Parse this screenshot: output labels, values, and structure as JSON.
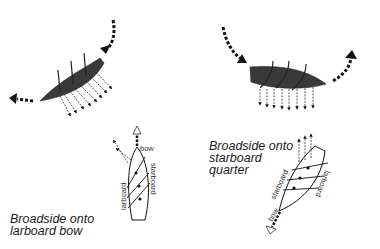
{
  "diagram": {
    "colors": {
      "hull_fill": "#3a3a3a",
      "ink": "#111111",
      "paper": "#ffffff"
    },
    "panels": [
      {
        "id": "top-left",
        "description": "Dark hull ship angled up-right, broadside fire arrows downward-right, curved dashed movement arrows"
      },
      {
        "id": "top-right",
        "description": "Dark hull ship horizontal, broadside fire arrows straight down, curved dashed movement arrows"
      },
      {
        "id": "bottom-left",
        "caption": "Broadside onto\nlarboard bow",
        "labels": {
          "bow": "bow",
          "starboard": "starboard",
          "larboard": "larboard"
        }
      },
      {
        "id": "bottom-right",
        "caption": "Broadside onto\nstarboard\nquarter",
        "labels": {
          "bow": "bow",
          "starboard": "starboard",
          "larboard": "larboard"
        }
      }
    ]
  }
}
